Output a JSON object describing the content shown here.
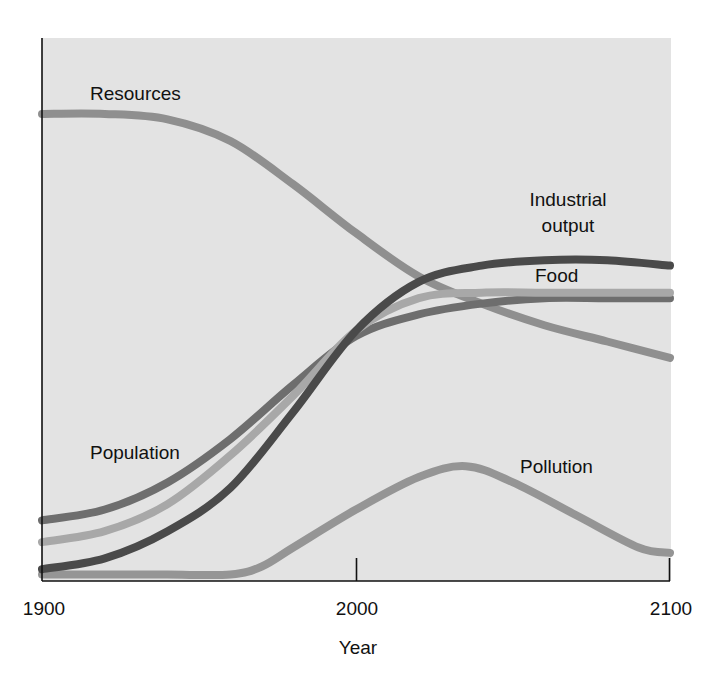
{
  "chart_data": {
    "type": "line",
    "title": "",
    "xlabel": "Year",
    "ylabel": "",
    "xlim": [
      1900,
      2100
    ],
    "ylim": [
      0,
      100
    ],
    "x_ticks": [
      1900,
      2000,
      2100
    ],
    "x_tick_labels": [
      "1900",
      "2000",
      "2100"
    ],
    "grid": false,
    "legend": "inline labels",
    "y_units": "relative (unlabeled axis)",
    "series": [
      {
        "name": "Resources",
        "color": "#8f8f8f",
        "x": [
          1900,
          1920,
          1940,
          1960,
          1980,
          2000,
          2020,
          2040,
          2060,
          2080,
          2100
        ],
        "values": [
          86,
          86,
          85,
          81,
          73,
          64,
          56,
          51,
          47,
          44,
          41
        ]
      },
      {
        "name": "Industrial output",
        "color": "#4a4a4a",
        "x": [
          1900,
          1920,
          1940,
          1960,
          1980,
          2000,
          2020,
          2040,
          2060,
          2080,
          2100
        ],
        "values": [
          2,
          4,
          9,
          17,
          31,
          46,
          55,
          58,
          59,
          59,
          58
        ]
      },
      {
        "name": "Food",
        "color": "#a8a8a8",
        "x": [
          1900,
          1920,
          1940,
          1960,
          1980,
          2000,
          2020,
          2040,
          2060,
          2080,
          2100
        ],
        "values": [
          7,
          9,
          14,
          23,
          34,
          46,
          52,
          53,
          53,
          53,
          53
        ]
      },
      {
        "name": "Population",
        "color": "#6e6e6e",
        "x": [
          1900,
          1920,
          1940,
          1960,
          1980,
          2000,
          2020,
          2040,
          2060,
          2080,
          2100
        ],
        "values": [
          11,
          13,
          18,
          26,
          36,
          45,
          49,
          51,
          52,
          52,
          52
        ]
      },
      {
        "name": "Pollution",
        "color": "#959595",
        "x": [
          1900,
          1920,
          1940,
          1960,
          1970,
          1980,
          2000,
          2020,
          2035,
          2050,
          2070,
          2090,
          2100
        ],
        "values": [
          1,
          1,
          1,
          1,
          2.5,
          6,
          13,
          19,
          21,
          18,
          12,
          6,
          5
        ]
      }
    ],
    "annotations": [
      {
        "text": "Resources",
        "series": "Resources"
      },
      {
        "text": "Industrial output",
        "series": "Industrial output"
      },
      {
        "text": "Food",
        "series": "Food"
      },
      {
        "text": "Population",
        "series": "Population"
      },
      {
        "text": "Pollution",
        "series": "Pollution"
      }
    ]
  },
  "labels": {
    "resources": "Resources",
    "industrial_line1": "Industrial",
    "industrial_line2": "output",
    "food": "Food",
    "population": "Population",
    "pollution": "Pollution",
    "x_axis_title": "Year",
    "tick_1900": "1900",
    "tick_2000": "2000",
    "tick_2100": "2100"
  },
  "colors": {
    "plot_background": "#e3e3e3",
    "axis": "#111111",
    "page_background": "#ffffff"
  }
}
